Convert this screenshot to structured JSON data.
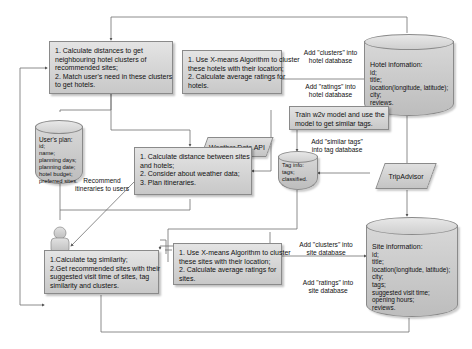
{
  "diagram": {
    "type": "flowchart",
    "title": ""
  },
  "processes": {
    "hotel_cluster_match": {
      "lines": [
        "1. Calculate distances to get",
        "neighbouring hotel clusters of",
        "recommended sites;",
        "2. Match user's need in these clusters",
        "to get hotels."
      ]
    },
    "hotel_xmeans": {
      "lines": [
        "1. Use X-means Algorithm to cluster",
        "these hotels with their location;",
        "2. Calculate average ratings for",
        "hotels."
      ]
    },
    "w2v": {
      "lines": [
        "Train w2v model and use the",
        "model to get similar tags."
      ]
    },
    "plan": {
      "lines": [
        "1. Calculate distance between sites",
        "and hotels;",
        "2. Consider about weather data;",
        "3. Plan itineraries."
      ]
    },
    "tag_similarity": {
      "lines": [
        "1.Calculate tag similarity;",
        "2.Get recommended sites with their",
        "suggested visit time of sites, tag",
        "similarity and clusters."
      ]
    },
    "site_xmeans": {
      "lines": [
        "1. Use X-means Algorithm to cluster",
        "these sites with their location;",
        "2. Calculate average ratings for",
        "sites."
      ]
    }
  },
  "inputs": {
    "weather": "Weather Data API",
    "tripadvisor": "TripAdvisor"
  },
  "databases": {
    "hotel": {
      "lines": [
        "Hotel infomation:",
        "id;",
        "title;",
        "location(longitude, latitude);",
        "city;",
        "reviews."
      ]
    },
    "user_plan": {
      "lines": [
        "User's plan:",
        "id;",
        "name;",
        "planning days;",
        "planning date;",
        "hotel budget;",
        "preferred sites."
      ]
    },
    "tag": {
      "lines": [
        "Tag info:",
        "tags;",
        "classified."
      ]
    },
    "site": {
      "lines": [
        "Site information:",
        "id;",
        "title;",
        "location(longitude, latitude);",
        "city;",
        "tags;",
        "suggested visit time;",
        "opening hours;",
        "reviews."
      ]
    }
  },
  "actor": {
    "label": "User"
  },
  "edge_labels": {
    "hotel_clusters": [
      "Add \"clusters\" into",
      "hotel database"
    ],
    "hotel_ratings": [
      "Add \"ratings\" into",
      "hotel database"
    ],
    "similar_tags": [
      "Add \"similar tags\"",
      "into tag database"
    ],
    "recommend": [
      "Recommend",
      "itineraries to users"
    ],
    "site_clusters": [
      "Add \"clusters\" into",
      "site database"
    ],
    "site_ratings": [
      "Add \"ratings\" into",
      "site database"
    ]
  },
  "colors": {
    "box_fill_top": "#e4e4e4",
    "box_fill_bottom": "#c8c8c8",
    "border": "#8a8a8a",
    "line": "#6e6e6e",
    "background": "#ffffff"
  }
}
